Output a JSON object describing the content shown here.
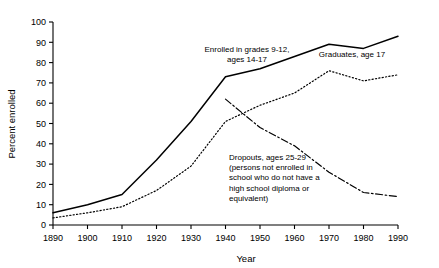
{
  "chart_data": {
    "type": "line",
    "title": "",
    "xlabel": "Year",
    "ylabel": "Percent enrolled",
    "xlim": [
      1890,
      1990
    ],
    "ylim": [
      0,
      100
    ],
    "grid": false,
    "legend_position": "inline-annotations",
    "x_ticks": [
      1890,
      1900,
      1910,
      1920,
      1930,
      1940,
      1950,
      1960,
      1970,
      1980,
      1990
    ],
    "y_ticks": [
      0,
      10,
      20,
      30,
      40,
      50,
      60,
      70,
      80,
      90,
      100
    ],
    "series": [
      {
        "name": "Enrolled in grades 9-12, ages 14-17",
        "style": "solid",
        "color": "#000000",
        "x": [
          1890,
          1900,
          1910,
          1920,
          1930,
          1940,
          1950,
          1960,
          1970,
          1980,
          1990
        ],
        "values": [
          6,
          10,
          15,
          32,
          51,
          73,
          77,
          83,
          89,
          87,
          93
        ]
      },
      {
        "name": "Graduates, age 17",
        "style": "dotted",
        "color": "#000000",
        "x": [
          1890,
          1900,
          1910,
          1920,
          1930,
          1940,
          1950,
          1960,
          1970,
          1980,
          1990
        ],
        "values": [
          3.5,
          6,
          9,
          17,
          29,
          51,
          59,
          65,
          76,
          71,
          74
        ]
      },
      {
        "name": "Dropouts, ages 25-29",
        "style": "dash-dot",
        "color": "#000000",
        "x": [
          1940,
          1950,
          1960,
          1970,
          1980,
          1990
        ],
        "values": [
          62,
          48,
          39,
          26,
          16,
          14
        ]
      }
    ],
    "annotations": [
      {
        "name": "enrolled-label",
        "lines": [
          "Enrolled in grades 9-12,",
          "ages 14-17"
        ],
        "x_px": 247,
        "y_px": 52,
        "anchor": "middle"
      },
      {
        "name": "graduates-label",
        "lines": [
          "Graduates, age 17"
        ],
        "x_px": 352,
        "y_px": 57,
        "anchor": "middle"
      },
      {
        "name": "dropouts-label",
        "lines": [
          "Dropouts, ages 25-29",
          "(persons not enrolled in",
          "school who do not have a",
          "high school diploma or",
          "equivalent)"
        ],
        "x_px": 229,
        "y_px": 160,
        "anchor": "start"
      }
    ]
  },
  "axes": {
    "y_title": "Percent enrolled",
    "x_title": "Year",
    "y_tick_labels": [
      "100",
      "90",
      "80",
      "70",
      "60",
      "50",
      "40",
      "30",
      "20",
      "10",
      "0"
    ],
    "x_tick_labels": [
      "1890",
      "1900",
      "1910",
      "1920",
      "1930",
      "1940",
      "1950",
      "1960",
      "1970",
      "1980",
      "1990"
    ]
  },
  "annotation_text": {
    "enrolled_line1": "Enrolled in grades 9-12,",
    "enrolled_line2": "ages 14-17",
    "graduates_line1": "Graduates, age 17",
    "dropouts_line1": "Dropouts, ages 25-29",
    "dropouts_line2": "(persons not enrolled in",
    "dropouts_line3": "school who do not have a",
    "dropouts_line4": "high school diploma or",
    "dropouts_line5": "equivalent)"
  },
  "colors": {
    "ink": "#000000",
    "background": "#ffffff"
  }
}
